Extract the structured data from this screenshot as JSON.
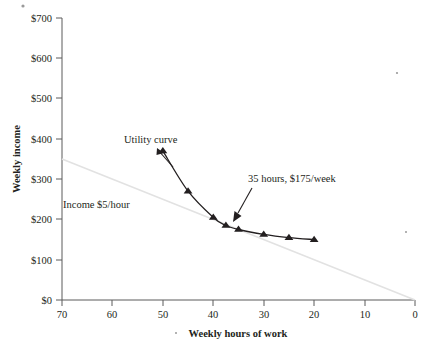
{
  "chart_data": {
    "type": "line",
    "title": "",
    "xlabel": "Weekly hours of work",
    "ylabel": "Weekly income",
    "xlim": [
      70,
      0
    ],
    "ylim": [
      0,
      700
    ],
    "x_reversed": true,
    "grid": false,
    "legend": "none",
    "xticks": [
      70,
      60,
      50,
      40,
      30,
      20,
      10,
      0
    ],
    "xtick_labels": [
      "70",
      "60",
      "50",
      "40",
      "30",
      "20",
      "10",
      "0"
    ],
    "yticks": [
      0,
      100,
      200,
      300,
      400,
      500,
      600,
      700
    ],
    "ytick_labels": [
      "$0",
      "$100",
      "$200",
      "$300",
      "$400",
      "$500",
      "$600",
      "$700"
    ],
    "series": [
      {
        "name": "Utility curve",
        "marker": "triangle",
        "color": "#231f20",
        "x": [
          50,
          45,
          40,
          37.5,
          35,
          30,
          25,
          20
        ],
        "values": [
          370,
          270,
          205,
          185,
          175,
          163,
          155,
          150
        ]
      },
      {
        "name": "Income $5/hour",
        "marker": "none",
        "color": "#e2e2e2",
        "x": [
          70,
          0
        ],
        "values": [
          350,
          0
        ]
      }
    ],
    "annotations": [
      {
        "label": "Utility curve",
        "text_x": 50,
        "text_y": 420,
        "point_x": 50,
        "point_y": 370
      },
      {
        "label": "35 hours, $175/week",
        "text_x": 27,
        "text_y": 330,
        "point_x": 35,
        "point_y": 175
      },
      {
        "label": "Income $5/hour",
        "text_x": 61,
        "text_y": 240,
        "point_x": null,
        "point_y": null
      }
    ]
  },
  "axes": {
    "ylabel": "Weekly income",
    "xlabel": "Weekly hours of work",
    "ytick_labels": [
      "$700",
      "$600",
      "$500",
      "$400",
      "$300",
      "$200",
      "$100",
      "$0"
    ],
    "xtick_labels": [
      "70",
      "60",
      "50",
      "40",
      "30",
      "20",
      "10",
      "0"
    ]
  },
  "labels": {
    "utility_curve": "Utility curve",
    "budget_line": "Income $5/hour",
    "callout": "35 hours, $175/week"
  },
  "colors": {
    "curve": "#231f20",
    "budget": "#e2e2e2",
    "axis": "#5b5b5b",
    "text": "#231f20",
    "background": "#ffffff"
  }
}
